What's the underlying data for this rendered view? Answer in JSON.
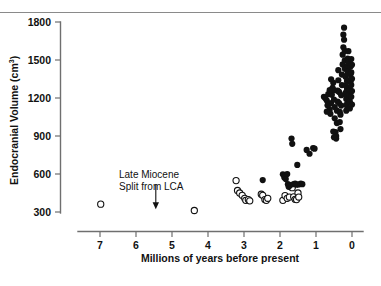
{
  "figure": {
    "background": "#ffffff",
    "ink_color": "#111111",
    "axis_color": "#6f6f6f",
    "top_rule_color": "#8a8a8a"
  },
  "annotation": {
    "line1": "Late Miocene",
    "line2": "Split from LCA",
    "arrow_x_value": 5.45,
    "arrow_y_top_value": 520,
    "arrow_y_bottom_value": 330
  },
  "chart_data": {
    "type": "scatter",
    "title": "",
    "xlabel": "Millions of years before present",
    "ylabel": "Endocranial Volume (cm",
    "ylabel_superscript": "3",
    "ylabel_suffix": ")",
    "xlim": [
      7.6,
      -0.3
    ],
    "ylim": [
      260,
      1840
    ],
    "x_reversed": true,
    "grid": false,
    "legend": "none",
    "xticks": [
      7,
      6,
      5,
      4,
      3,
      2,
      1,
      0
    ],
    "xticklabels": [
      "7",
      "6",
      "5",
      "4",
      "3",
      "2",
      "1",
      "0"
    ],
    "yticks": [
      300,
      600,
      900,
      1200,
      1500,
      1800
    ],
    "yticklabels": [
      "300",
      "600",
      "900",
      "1200",
      "1500",
      "1800"
    ],
    "series": [
      {
        "name": "open-circles",
        "marker": "open-circle",
        "marker_size": 6.2,
        "color": "#ffffff",
        "edge_color": "#111111",
        "points": [
          [
            6.98,
            362
          ],
          [
            4.38,
            312
          ],
          [
            3.22,
            548
          ],
          [
            3.18,
            470
          ],
          [
            3.12,
            450
          ],
          [
            3.05,
            432
          ],
          [
            2.98,
            408
          ],
          [
            2.95,
            392
          ],
          [
            2.88,
            398
          ],
          [
            2.84,
            388
          ],
          [
            2.52,
            440
          ],
          [
            2.48,
            432
          ],
          [
            2.42,
            398
          ],
          [
            2.38,
            392
          ],
          [
            2.34,
            408
          ],
          [
            1.92,
            392
          ],
          [
            1.86,
            430
          ],
          [
            1.8,
            408
          ],
          [
            1.74,
            418
          ],
          [
            1.7,
            500
          ],
          [
            1.66,
            492
          ],
          [
            1.62,
            420
          ],
          [
            1.58,
            400
          ],
          [
            1.54,
            398
          ],
          [
            1.5,
            450
          ],
          [
            1.48,
            418
          ]
        ]
      },
      {
        "name": "filled-circles",
        "marker": "filled-circle",
        "marker_size": 6.2,
        "color": "#111111",
        "points": [
          [
            2.48,
            552
          ],
          [
            1.92,
            598
          ],
          [
            1.88,
            572
          ],
          [
            1.84,
            560
          ],
          [
            1.8,
            600
          ],
          [
            1.78,
            520
          ],
          [
            1.76,
            500
          ],
          [
            1.72,
            512
          ],
          [
            1.68,
            880
          ],
          [
            1.66,
            838
          ],
          [
            1.62,
            520
          ],
          [
            1.58,
            524
          ],
          [
            1.54,
            516
          ],
          [
            1.52,
            672
          ],
          [
            1.48,
            518
          ],
          [
            1.42,
            524
          ],
          [
            1.38,
            520
          ],
          [
            1.26,
            790
          ],
          [
            1.18,
            760
          ],
          [
            1.08,
            805
          ],
          [
            1.04,
            800
          ],
          [
            0.78,
            1210
          ],
          [
            0.74,
            1198
          ],
          [
            0.7,
            1180
          ],
          [
            0.66,
            1230
          ],
          [
            0.64,
            1152
          ],
          [
            0.62,
            1108
          ],
          [
            0.6,
            1075
          ],
          [
            0.58,
            1160
          ],
          [
            0.56,
            1225
          ],
          [
            0.54,
            1280
          ],
          [
            0.52,
            1320
          ],
          [
            0.5,
            1262
          ],
          [
            0.5,
            1188
          ],
          [
            0.48,
            1128
          ],
          [
            0.48,
            1040
          ],
          [
            0.46,
            930
          ],
          [
            0.44,
            900
          ],
          [
            0.44,
            880
          ],
          [
            0.42,
            1002
          ],
          [
            0.42,
            1100
          ],
          [
            0.4,
            1172
          ],
          [
            0.4,
            1258
          ],
          [
            0.38,
            1340
          ],
          [
            0.38,
            1420
          ],
          [
            0.36,
            1248
          ],
          [
            0.36,
            1160
          ],
          [
            0.34,
            1090
          ],
          [
            0.34,
            1010
          ],
          [
            0.32,
            955
          ],
          [
            0.32,
            1068
          ],
          [
            0.3,
            1140
          ],
          [
            0.3,
            1222
          ],
          [
            0.28,
            1302
          ],
          [
            0.28,
            1385
          ],
          [
            0.26,
            1465
          ],
          [
            0.26,
            1542
          ],
          [
            0.24,
            1600
          ],
          [
            0.24,
            1700
          ],
          [
            0.22,
            1755
          ],
          [
            0.22,
            1660
          ],
          [
            0.2,
            1572
          ],
          [
            0.2,
            1498
          ],
          [
            0.2,
            1430
          ],
          [
            0.18,
            1368
          ],
          [
            0.18,
            1300
          ],
          [
            0.18,
            1240
          ],
          [
            0.16,
            1192
          ],
          [
            0.16,
            1145
          ],
          [
            0.16,
            1100
          ],
          [
            0.14,
            1208
          ],
          [
            0.14,
            1272
          ],
          [
            0.14,
            1335
          ],
          [
            0.12,
            1392
          ],
          [
            0.12,
            1452
          ],
          [
            0.12,
            1512
          ],
          [
            0.1,
            1570
          ],
          [
            0.1,
            1478
          ],
          [
            0.1,
            1408
          ],
          [
            0.08,
            1342
          ],
          [
            0.08,
            1282
          ],
          [
            0.08,
            1225
          ],
          [
            0.06,
            1172
          ],
          [
            0.06,
            1118
          ],
          [
            0.06,
            1262
          ],
          [
            0.04,
            1328
          ],
          [
            0.04,
            1388
          ],
          [
            0.04,
            1448
          ],
          [
            0.02,
            1508
          ],
          [
            0.02,
            1402
          ],
          [
            0.02,
            1302
          ],
          [
            0.02,
            1210
          ],
          [
            0.0,
            1148
          ],
          [
            0.0,
            1255
          ],
          [
            0.0,
            1352
          ],
          [
            0.0,
            1462
          ],
          [
            0.62,
            1262
          ],
          [
            0.58,
            1348
          ],
          [
            0.7,
            1092
          ],
          [
            0.68,
            1142
          ],
          [
            0.5,
            890
          ],
          [
            0.52,
            935
          ]
        ]
      }
    ]
  }
}
